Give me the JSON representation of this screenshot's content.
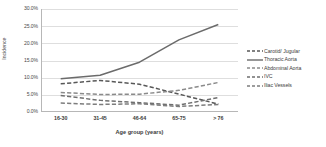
{
  "chart_data": {
    "type": "line",
    "title": "",
    "xlabel": "Age group (years)",
    "ylabel": "Incidence",
    "categories": [
      "16-30",
      "31-45",
      "46-64",
      "65-75",
      "> 76"
    ],
    "ytick_labels": [
      "0.0%",
      "5.0%",
      "10.0%",
      "15.0%",
      "20.0%",
      "25.0%",
      "30.0%"
    ],
    "ytick_values": [
      0,
      5,
      10,
      15,
      20,
      25,
      30
    ],
    "ylim": [
      0,
      30
    ],
    "grid": true,
    "legend_position": "right",
    "series": [
      {
        "name": "Carotid/ Jugular",
        "values": [
          8.2,
          9.2,
          8.1,
          5.2,
          2.3
        ],
        "style": "dashed",
        "color": "#585858"
      },
      {
        "name": "Thoracic Aorta",
        "values": [
          9.7,
          10.7,
          14.5,
          21.0,
          25.5
        ],
        "style": "solid",
        "color": "#6b6b6b"
      },
      {
        "name": "Abdominal Aorta",
        "values": [
          5.7,
          5.1,
          5.2,
          6.3,
          8.6
        ],
        "style": "dashed",
        "color": "#8a8a8a"
      },
      {
        "name": "IVC",
        "values": [
          4.8,
          3.4,
          2.7,
          2.0,
          4.2
        ],
        "style": "dashed",
        "color": "#6f6f6f"
      },
      {
        "name": "Iliac Vessels",
        "values": [
          2.6,
          2.2,
          2.4,
          1.6,
          2.2
        ],
        "style": "dashed",
        "color": "#7d7d7d"
      }
    ]
  },
  "legend": {
    "items": [
      {
        "label": "Carotid/ Jugular"
      },
      {
        "label": "Thoracic Aorta"
      },
      {
        "label": "Abdominal Aorta"
      },
      {
        "label": "IVC"
      },
      {
        "label": "Iliac Vessels"
      }
    ]
  }
}
